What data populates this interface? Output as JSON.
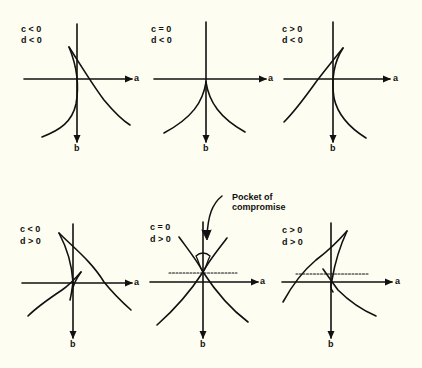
{
  "figure": {
    "axis_labels": {
      "horizontal": "a",
      "vertical": "b"
    },
    "panels": [
      {
        "id": "p1",
        "c": "c < 0",
        "d": "d < 0",
        "row": 1,
        "col": 1,
        "dotted_line": false
      },
      {
        "id": "p2",
        "c": "c = 0",
        "d": "d < 0",
        "row": 1,
        "col": 2,
        "dotted_line": false
      },
      {
        "id": "p3",
        "c": "c > 0",
        "d": "d < 0",
        "row": 1,
        "col": 3,
        "dotted_line": false
      },
      {
        "id": "p4",
        "c": "c < 0",
        "d": "d > 0",
        "row": 2,
        "col": 1,
        "dotted_line": false
      },
      {
        "id": "p5",
        "c": "c = 0",
        "d": "d > 0",
        "row": 2,
        "col": 2,
        "dotted_line": true
      },
      {
        "id": "p6",
        "c": "c > 0",
        "d": "d > 0",
        "row": 2,
        "col": 3,
        "dotted_line": true
      }
    ],
    "annotation": {
      "line1": "Pocket of",
      "line2": "compromise"
    },
    "colors": {
      "background": "#fdfdf1",
      "ink": "#111111"
    }
  }
}
